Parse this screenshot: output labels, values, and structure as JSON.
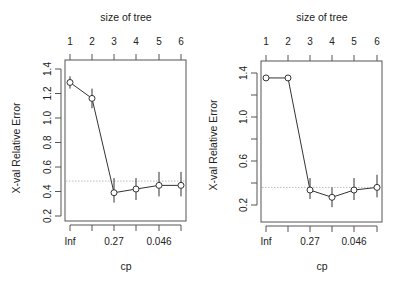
{
  "chart_data": [
    {
      "type": "line",
      "title": "",
      "xlabel": "cp",
      "ylabel": "X-val Relative Error",
      "top_axis_label": "size of tree",
      "top_ticks": [
        "1",
        "2",
        "3",
        "4",
        "5",
        "6"
      ],
      "bottom_tick_labels": [
        "Inf",
        "",
        "0.27",
        "",
        "0.046",
        ""
      ],
      "yticks": [
        "0.2",
        "0.4",
        "0.6",
        "0.8",
        "1.0",
        "1.2",
        "1.4"
      ],
      "ytick_values": [
        0.2,
        0.4,
        0.6,
        0.8,
        1.0,
        1.2,
        1.4
      ],
      "ylim": [
        0.17,
        1.49
      ],
      "x": [
        1,
        2,
        3,
        4,
        5,
        6
      ],
      "values": [
        1.29,
        1.16,
        0.39,
        0.42,
        0.45,
        0.45
      ],
      "error_low": [
        1.24,
        1.08,
        0.31,
        0.33,
        0.36,
        0.36
      ],
      "error_high": [
        1.34,
        1.24,
        0.51,
        0.51,
        0.56,
        0.56
      ],
      "reference_line": 0.485,
      "grid": false,
      "legend": null
    },
    {
      "type": "line",
      "title": "",
      "xlabel": "cp",
      "ylabel": "X-val Relative Error",
      "top_axis_label": "size of tree",
      "top_ticks": [
        "1",
        "2",
        "3",
        "4",
        "5",
        "6"
      ],
      "bottom_tick_labels": [
        "Inf",
        "",
        "0.27",
        "",
        "0.046",
        ""
      ],
      "yticks": [
        "0.2",
        "",
        "0.6",
        "",
        "1.0",
        "",
        "1.4"
      ],
      "ytick_values": [
        0.2,
        0.4,
        0.6,
        0.8,
        1.0,
        1.2,
        1.4
      ],
      "ylim": [
        0.05,
        1.52
      ],
      "x": [
        1,
        2,
        3,
        4,
        5,
        6
      ],
      "values": [
        1.355,
        1.355,
        0.336,
        0.27,
        0.336,
        0.36
      ],
      "error_low": [
        1.355,
        1.355,
        0.255,
        0.18,
        0.245,
        0.27
      ],
      "error_high": [
        1.355,
        1.355,
        0.445,
        0.36,
        0.445,
        0.475
      ],
      "reference_line": 0.36,
      "grid": false,
      "legend": null
    }
  ],
  "layout": {
    "panels": [
      {
        "frame": {
          "left": 65,
          "top": 60,
          "right": 186,
          "bottom": 221
        },
        "x_px": [
          70,
          92,
          114,
          136,
          159,
          181
        ],
        "y_px_per_unit": 122.5,
        "y_at_0_2": 216,
        "top_title_x": 126,
        "ylabel_x": 20,
        "ylabel_y": 148
      },
      {
        "frame": {
          "left": 261,
          "top": 61,
          "right": 382,
          "bottom": 222
        },
        "x_px": [
          266,
          288,
          310,
          332,
          354,
          377
        ],
        "y_px_per_unit": 110,
        "y_at_0_2": 205,
        "top_title_x": 322,
        "ylabel_x": 217,
        "ylabel_y": 145
      }
    ],
    "colors": {
      "axis": "#555555",
      "line": "#333333",
      "reference": "#bbbbbb"
    }
  }
}
